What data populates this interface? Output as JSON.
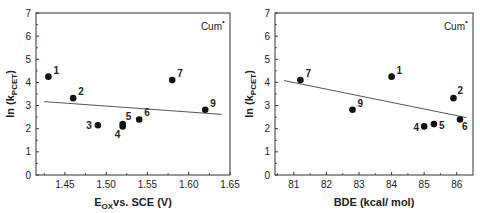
{
  "chart_data": [
    {
      "type": "scatter",
      "title": "",
      "annotation": "Cum•",
      "xlabel": "E_OX vs. SCE (V)",
      "xlabel_main": "E",
      "xlabel_sub": "OX",
      "xlabel_rest": "vs. SCE (V)",
      "ylabel": "ln (k_PCET)",
      "xlim": [
        1.415,
        1.65
      ],
      "ylim": [
        0,
        7
      ],
      "xticks": [
        1.45,
        1.5,
        1.55,
        1.6,
        1.65
      ],
      "xtick_labels": [
        "1.45",
        "1.50",
        "1.55",
        "1.60",
        "1.65"
      ],
      "yticks": [
        0,
        1,
        2,
        3,
        4,
        5,
        6,
        7
      ],
      "grid": false,
      "points": [
        {
          "label": "1",
          "x": 1.43,
          "y": 4.25
        },
        {
          "label": "2",
          "x": 1.46,
          "y": 3.32
        },
        {
          "label": "3",
          "x": 1.49,
          "y": 2.15
        },
        {
          "label": "4",
          "x": 1.52,
          "y": 2.1
        },
        {
          "label": "5",
          "x": 1.52,
          "y": 2.2
        },
        {
          "label": "6",
          "x": 1.54,
          "y": 2.4
        },
        {
          "label": "7",
          "x": 1.58,
          "y": 4.1
        },
        {
          "label": "9",
          "x": 1.62,
          "y": 2.82
        }
      ],
      "fit_line": {
        "x": [
          1.425,
          1.64
        ],
        "y": [
          3.17,
          2.62
        ]
      }
    },
    {
      "type": "scatter",
      "title": "",
      "annotation": "Cum•",
      "xlabel": "BDE (kcal/ mol)",
      "ylabel": "ln (k_PCET)",
      "xlim": [
        80.42,
        86.5
      ],
      "ylim": [
        0,
        7
      ],
      "xticks": [
        81,
        82,
        83,
        84,
        85,
        86
      ],
      "xtick_labels": [
        "81",
        "82",
        "83",
        "84",
        "85",
        "86"
      ],
      "yticks": [
        0,
        1,
        2,
        3,
        4,
        5,
        6,
        7
      ],
      "grid": false,
      "points": [
        {
          "label": "1",
          "x": 84.0,
          "y": 4.25
        },
        {
          "label": "2",
          "x": 85.9,
          "y": 3.32
        },
        {
          "label": "4",
          "x": 85.0,
          "y": 2.1
        },
        {
          "label": "5",
          "x": 85.3,
          "y": 2.2
        },
        {
          "label": "6",
          "x": 86.1,
          "y": 2.4
        },
        {
          "label": "7",
          "x": 81.2,
          "y": 4.1
        },
        {
          "label": "9",
          "x": 82.8,
          "y": 2.82
        }
      ],
      "fit_line": {
        "x": [
          80.7,
          86.3
        ],
        "y": [
          4.08,
          2.48
        ]
      }
    }
  ],
  "charts": {
    "left": {
      "annotation": "Cum",
      "ylabel_main": "ln (k",
      "ylabel_sub": "PCET",
      "ylabel_end": ")",
      "xlabel_main": "E",
      "xlabel_sub": "OX",
      "xlabel_rest": "vs. SCE (V)"
    },
    "right": {
      "annotation": "Cum",
      "ylabel_main": "ln (k",
      "ylabel_sub": "PCET",
      "ylabel_end": ")",
      "xlabel": "BDE (kcal/ mol)"
    }
  },
  "colors": {
    "axis": "#333333",
    "marker": "#111111",
    "fit_line": "#555555",
    "text": "#222222"
  }
}
